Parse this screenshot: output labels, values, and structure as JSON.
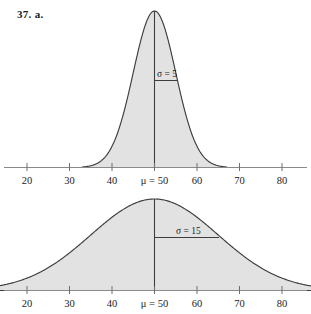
{
  "problem": {
    "label": "37. a."
  },
  "figures": [
    {
      "id": "a",
      "mu_label": "μ = 50",
      "sigma_label": "σ = 5",
      "tick_labels": [
        "20",
        "30",
        "40",
        "60",
        "70",
        "80"
      ]
    },
    {
      "id": "b",
      "mu_label": "μ = 50",
      "sigma_label": "σ = 15",
      "tick_labels": [
        "20",
        "30",
        "40",
        "60",
        "70",
        "80"
      ]
    }
  ],
  "colors": {
    "fill": "#e2e2e2",
    "curve_stroke": "#3d3d3d",
    "axis": "#8a8a8a",
    "text": "#1c1c1c",
    "background": "#ffffff"
  },
  "chart_data": [
    {
      "type": "line",
      "title": "",
      "subtitle": "",
      "distribution": "normal",
      "mu": 50,
      "sigma": 5,
      "mu_annotation": "μ = 50",
      "sigma_annotation": "σ = 5",
      "xlabel": "",
      "ylabel": "",
      "xlim": [
        16,
        85
      ],
      "ticks": [
        20,
        30,
        40,
        50,
        60,
        70,
        80
      ],
      "tick_labels": [
        "20",
        "30",
        "40",
        "μ = 50",
        "60",
        "70",
        "80"
      ],
      "grid": false,
      "legend": "none",
      "fill_under_curve": true,
      "x": [
        30,
        35,
        37.5,
        40,
        42.5,
        45,
        47.5,
        50,
        52.5,
        55,
        57.5,
        60,
        62.5,
        65,
        70
      ],
      "y": [
        0.0004,
        0.0108,
        0.0302,
        0.0648,
        0.108,
        0.1429,
        0.1619,
        0.1684,
        0.1619,
        0.1429,
        0.108,
        0.0648,
        0.0302,
        0.0108,
        0.0004
      ]
    },
    {
      "type": "line",
      "title": "",
      "subtitle": "",
      "distribution": "normal",
      "mu": 50,
      "sigma": 15,
      "mu_annotation": "μ = 50",
      "sigma_annotation": "σ = 15",
      "xlabel": "",
      "ylabel": "",
      "xlim": [
        16,
        85
      ],
      "ticks": [
        20,
        30,
        40,
        50,
        60,
        70,
        80
      ],
      "tick_labels": [
        "20",
        "30",
        "40",
        "μ = 50",
        "60",
        "70",
        "80"
      ],
      "grid": false,
      "legend": "none",
      "fill_under_curve": true,
      "x": [
        10,
        15,
        20,
        25,
        30,
        35,
        40,
        45,
        50,
        55,
        60,
        65,
        70,
        75,
        80,
        85,
        90
      ],
      "y": [
        0.0021,
        0.004,
        0.0073,
        0.012,
        0.018,
        0.0242,
        0.0291,
        0.0321,
        0.0266,
        0.0321,
        0.0291,
        0.0242,
        0.018,
        0.012,
        0.0073,
        0.004,
        0.0021
      ]
    }
  ]
}
